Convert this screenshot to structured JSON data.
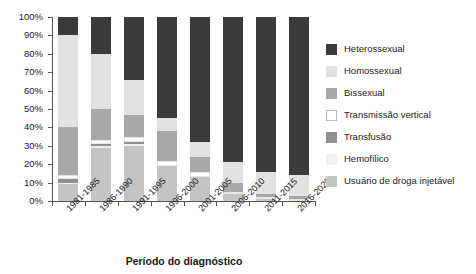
{
  "chart_data": {
    "type": "bar",
    "stacked": true,
    "normalized": true,
    "title": "",
    "xlabel": "Período do diagnóstico",
    "ylabel": "",
    "ylim": [
      0,
      100
    ],
    "ytick_labels": [
      "100%",
      "90%",
      "80%",
      "70%",
      "60%",
      "50%",
      "40%",
      "30%",
      "20%",
      "10%",
      "0%"
    ],
    "ytick_values": [
      100,
      90,
      80,
      70,
      60,
      50,
      40,
      30,
      20,
      10,
      0
    ],
    "grid": false,
    "legend_position": "right",
    "categories": [
      "1981-1985",
      "1986-1990",
      "1991-1995",
      "1996-2000",
      "2001-2005",
      "2006-2010",
      "2011-2015",
      "2016-2020"
    ],
    "series": [
      {
        "name": "Heterossexual",
        "color": "#3b3b3b",
        "values": [
          10,
          20,
          34,
          55,
          68,
          79,
          84,
          86
        ]
      },
      {
        "name": "Homossexual",
        "color": "#e2e2e2",
        "values": [
          50,
          30,
          19,
          7,
          8,
          11,
          12,
          11
        ]
      },
      {
        "name": "Bissexual",
        "color": "#a8a8a8",
        "values": [
          26,
          17,
          12,
          16,
          8,
          5,
          2,
          2
        ]
      },
      {
        "name": "Transmissão vertical",
        "color": "#ffffff",
        "values": [
          2,
          2,
          3,
          3,
          3,
          1,
          1,
          1
        ]
      },
      {
        "name": "Transfusão",
        "color": "#8f8f8f",
        "values": [
          2,
          1,
          1,
          0,
          0,
          0,
          0,
          0
        ]
      },
      {
        "name": "Hemofílico",
        "color": "#f0f0f0",
        "values": [
          1,
          1,
          1,
          0,
          0,
          0,
          0,
          0
        ]
      },
      {
        "name": "Usuário de droga injetável",
        "color": "#c4c4c4",
        "values": [
          9,
          29,
          30,
          19,
          13,
          4,
          1,
          0
        ]
      }
    ]
  },
  "legend": {
    "items": [
      {
        "label": "Heterossexual",
        "color": "#3b3b3b"
      },
      {
        "label": "Homossexual",
        "color": "#e2e2e2"
      },
      {
        "label": "Bissexual",
        "color": "#a8a8a8"
      },
      {
        "label": "Transmissão vertical",
        "color": "#ffffff"
      },
      {
        "label": "Transfusão",
        "color": "#8f8f8f"
      },
      {
        "label": "Hemofílico",
        "color": "#f0f0f0"
      },
      {
        "label": "Usuário de droga injetável",
        "color": "#c4c4c4"
      }
    ]
  }
}
